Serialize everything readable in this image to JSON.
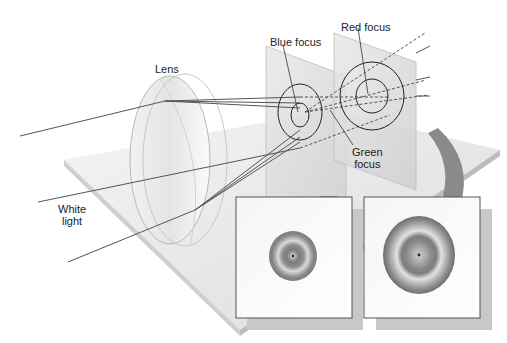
{
  "diagram": {
    "labels": {
      "lens": "Lens",
      "white_light_line1": "White",
      "white_light_line2": "light",
      "blue_focus": "Blue focus",
      "red_focus": "Red focus",
      "green_focus_line1": "Green",
      "green_focus_line2": "focus"
    },
    "components": [
      {
        "id": "lens",
        "kind": "converging lens"
      },
      {
        "id": "screen-1",
        "kind": "screen at blue focus"
      },
      {
        "id": "screen-2",
        "kind": "screen at red focus"
      },
      {
        "id": "inset-1",
        "kind": "image on screen at blue focus",
        "rings": 2
      },
      {
        "id": "inset-2",
        "kind": "image on screen at red focus",
        "rings": 2
      }
    ],
    "rays": [
      {
        "name": "top-ray",
        "focus": [
          "blue",
          "green",
          "red"
        ]
      },
      {
        "name": "middle-ray",
        "focus": [
          "blue",
          "green",
          "red"
        ]
      },
      {
        "name": "bottom-ray",
        "focus": [
          "blue",
          "green",
          "red"
        ]
      }
    ],
    "colors": {
      "background": "#ffffff",
      "platform_top": "#e6e6e6",
      "platform_edge": "#c8c8c8",
      "screen": "#dcdcdc",
      "ray": "#555555",
      "circle_stroke": "#222222",
      "ring_dark": "#7a7a7a",
      "ring_light": "#e0e0e0",
      "arrow": "#8a8a8a"
    }
  }
}
